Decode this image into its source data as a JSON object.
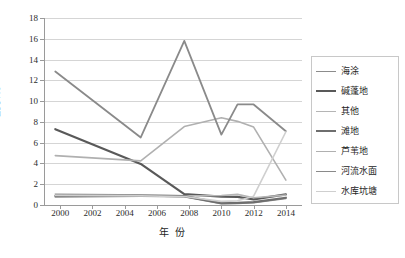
{
  "chart_data": {
    "type": "line",
    "title": "",
    "xlabel": "年 份",
    "ylabel": "LPI /%",
    "xlim": [
      1999,
      2015
    ],
    "ylim": [
      0,
      18
    ],
    "ytick_step": 2,
    "xtick_step": 2,
    "grid": true,
    "legend_position": "right",
    "yticks": [
      "0",
      "2",
      "4",
      "6",
      "8",
      "10",
      "12",
      "14",
      "16",
      "18"
    ],
    "xticks": [
      "2000",
      "2002",
      "2004",
      "2006",
      "2008",
      "2010",
      "2012",
      "2014"
    ],
    "series": [
      {
        "name": "海涂",
        "color": "#8c8c8c",
        "width": 1.6,
        "x": [
          1999.7,
          2005,
          2007.7,
          2010,
          2011,
          2012,
          2014
        ],
        "values": [
          0.78,
          0.85,
          0.8,
          0.12,
          0.15,
          0.22,
          0.62
        ]
      },
      {
        "name": "碱蓬地",
        "color": "#595959",
        "width": 2.2,
        "x": [
          1999.7,
          2005,
          2007.7,
          2010,
          2011,
          2012,
          2014
        ],
        "values": [
          7.3,
          3.95,
          1.05,
          0.8,
          0.78,
          0.55,
          1.02
        ]
      },
      {
        "name": "其他",
        "color": "#b5b5b5",
        "width": 1.6,
        "x": [
          1999.7,
          2005,
          2007.7,
          2010,
          2011,
          2012,
          2014
        ],
        "values": [
          1.05,
          0.95,
          0.88,
          0.92,
          1.02,
          0.7,
          0.95
        ]
      },
      {
        "name": "滩地",
        "color": "#6e6e6e",
        "width": 2.2,
        "x": [
          1999.7,
          2005,
          2007.7,
          2010,
          2011,
          2012,
          2014
        ],
        "values": [
          0.88,
          0.9,
          0.85,
          0.18,
          0.2,
          0.28,
          0.7
        ]
      },
      {
        "name": "芦苇地",
        "color": "#b0b0b0",
        "width": 1.6,
        "x": [
          1999.7,
          2005,
          2007.7,
          2010,
          2011,
          2012,
          2014
        ],
        "values": [
          4.75,
          4.25,
          7.55,
          8.4,
          8.05,
          7.5,
          2.4
        ]
      },
      {
        "name": "河流水面",
        "color": "#8a8a8a",
        "width": 1.8,
        "x": [
          1999.7,
          2005,
          2007.7,
          2010,
          2011,
          2012,
          2014
        ],
        "values": [
          12.85,
          6.5,
          15.8,
          6.78,
          9.68,
          9.68,
          7.1
        ]
      },
      {
        "name": "水库坑塘",
        "color": "#cfcfcf",
        "width": 1.6,
        "x": [
          1999.7,
          2005,
          2007.7,
          2010,
          2011,
          2012,
          2014
        ],
        "values": [
          0.92,
          0.88,
          0.82,
          0.35,
          0.4,
          0.85,
          7.05
        ]
      }
    ]
  },
  "legend": {
    "items": [
      {
        "label": "海涂"
      },
      {
        "label": "碱蓬地"
      },
      {
        "label": "其他"
      },
      {
        "label": "滩地"
      },
      {
        "label": "芦苇地"
      },
      {
        "label": "河流水面"
      },
      {
        "label": "水库坑塘"
      }
    ]
  }
}
